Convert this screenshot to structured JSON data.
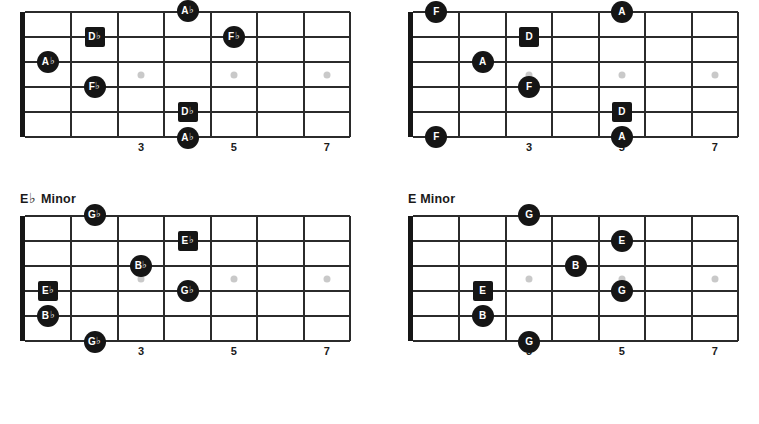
{
  "page": {
    "background": "#ffffff",
    "note_fill": "#151515",
    "line_color": "#2b2b2b",
    "inlay_color": "#c9c9c9"
  },
  "fretboard": {
    "string_count": 6,
    "fret_count": 7,
    "fret_numbers": [
      {
        "label": "3",
        "fret": 3
      },
      {
        "label": "5",
        "fret": 5
      },
      {
        "label": "7",
        "fret": 7
      }
    ],
    "inlay_frets": [
      3,
      5,
      7
    ]
  },
  "diagrams": [
    {
      "id": "ab-minor",
      "position": "top-left",
      "title": "A",
      "title_accidental": "♭",
      "title_suffix": " Minor",
      "title_visible": false,
      "notes": [
        {
          "label": "A",
          "accidental": "♭",
          "shape": "circle",
          "string": 1,
          "fret": 4,
          "offset": "above"
        },
        {
          "label": "D",
          "accidental": "♭",
          "shape": "square",
          "string": 2,
          "fret": 2,
          "offset": "on"
        },
        {
          "label": "F",
          "accidental": "♭",
          "shape": "circle",
          "string": 2,
          "fret": 5,
          "offset": "on"
        },
        {
          "label": "A",
          "accidental": "♭",
          "shape": "circle",
          "string": 3,
          "fret": 1,
          "offset": "on"
        },
        {
          "label": "F",
          "accidental": "♭",
          "shape": "circle",
          "string": 4,
          "fret": 2,
          "offset": "on"
        },
        {
          "label": "D",
          "accidental": "♭",
          "shape": "square",
          "string": 5,
          "fret": 4,
          "offset": "on"
        },
        {
          "label": "A",
          "accidental": "♭",
          "shape": "circle",
          "string": 6,
          "fret": 4,
          "offset": "below"
        }
      ]
    },
    {
      "id": "d-minor",
      "position": "top-right",
      "title": "D",
      "title_accidental": "",
      "title_suffix": " Minor",
      "title_visible": false,
      "notes": [
        {
          "label": "F",
          "accidental": "",
          "shape": "circle",
          "string": 1,
          "fret": 1,
          "offset": "on"
        },
        {
          "label": "A",
          "accidental": "",
          "shape": "circle",
          "string": 1,
          "fret": 5,
          "offset": "on"
        },
        {
          "label": "D",
          "accidental": "",
          "shape": "square",
          "string": 2,
          "fret": 3,
          "offset": "on"
        },
        {
          "label": "A",
          "accidental": "",
          "shape": "circle",
          "string": 3,
          "fret": 2,
          "offset": "on"
        },
        {
          "label": "F",
          "accidental": "",
          "shape": "circle",
          "string": 4,
          "fret": 3,
          "offset": "on"
        },
        {
          "label": "D",
          "accidental": "",
          "shape": "square",
          "string": 5,
          "fret": 5,
          "offset": "on"
        },
        {
          "label": "F",
          "accidental": "",
          "shape": "circle",
          "string": 6,
          "fret": 1,
          "offset": "on"
        },
        {
          "label": "A",
          "accidental": "",
          "shape": "circle",
          "string": 6,
          "fret": 5,
          "offset": "on"
        }
      ]
    },
    {
      "id": "eb-minor",
      "position": "bottom-left",
      "title": "E",
      "title_accidental": "♭",
      "title_suffix": " Minor",
      "title_visible": true,
      "notes": [
        {
          "label": "G",
          "accidental": "♭",
          "shape": "circle",
          "string": 1,
          "fret": 2,
          "offset": "above"
        },
        {
          "label": "E",
          "accidental": "♭",
          "shape": "square",
          "string": 2,
          "fret": 4,
          "offset": "on"
        },
        {
          "label": "B",
          "accidental": "♭",
          "shape": "circle",
          "string": 3,
          "fret": 3,
          "offset": "on"
        },
        {
          "label": "E",
          "accidental": "♭",
          "shape": "square",
          "string": 4,
          "fret": 1,
          "offset": "on"
        },
        {
          "label": "G",
          "accidental": "♭",
          "shape": "circle",
          "string": 4,
          "fret": 4,
          "offset": "on"
        },
        {
          "label": "B",
          "accidental": "♭",
          "shape": "circle",
          "string": 5,
          "fret": 1,
          "offset": "on"
        },
        {
          "label": "G",
          "accidental": "♭",
          "shape": "circle",
          "string": 6,
          "fret": 2,
          "offset": "below"
        }
      ]
    },
    {
      "id": "e-minor",
      "position": "bottom-right",
      "title": "E",
      "title_accidental": "",
      "title_suffix": " Minor",
      "title_visible": true,
      "notes": [
        {
          "label": "G",
          "accidental": "",
          "shape": "circle",
          "string": 1,
          "fret": 3,
          "offset": "above"
        },
        {
          "label": "E",
          "accidental": "",
          "shape": "circle",
          "string": 2,
          "fret": 5,
          "offset": "on"
        },
        {
          "label": "B",
          "accidental": "",
          "shape": "circle",
          "string": 3,
          "fret": 4,
          "offset": "on"
        },
        {
          "label": "E",
          "accidental": "",
          "shape": "square",
          "string": 4,
          "fret": 2,
          "offset": "on"
        },
        {
          "label": "G",
          "accidental": "",
          "shape": "circle",
          "string": 4,
          "fret": 5,
          "offset": "on"
        },
        {
          "label": "B",
          "accidental": "",
          "shape": "circle",
          "string": 5,
          "fret": 2,
          "offset": "on"
        },
        {
          "label": "G",
          "accidental": "",
          "shape": "circle",
          "string": 6,
          "fret": 3,
          "offset": "below"
        }
      ]
    }
  ]
}
